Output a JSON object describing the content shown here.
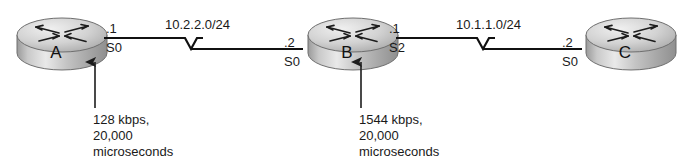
{
  "diagram": {
    "type": "network-topology",
    "background_color": "#ffffff",
    "line_color": "#111111",
    "router_body_color": "#b9b9b9",
    "router_top_color": "#d6d6d6",
    "routers": [
      {
        "id": "router-a",
        "name": "A",
        "interface_label": "S0",
        "ip_host_label": ".1",
        "icon": "router-icon"
      },
      {
        "id": "router-b",
        "name": "B",
        "left_interface_label": "S0",
        "left_ip_host_label": ".2",
        "right_interface_label": "S2",
        "right_ip_host_label": ".1",
        "icon": "router-icon"
      },
      {
        "id": "router-c",
        "name": "C",
        "interface_label": "S0",
        "ip_host_label": ".2",
        "icon": "router-icon"
      }
    ],
    "links": [
      {
        "id": "link-a-b",
        "subnet_label": "10.2.2.0/24",
        "media": "serial",
        "left_endpoint": "A S0 .1",
        "right_endpoint": "B S0 .2"
      },
      {
        "id": "link-b-c",
        "subnet_label": "10.1.1.0/24",
        "media": "serial",
        "left_endpoint": "B S2 .1",
        "right_endpoint": "C S0 .2"
      }
    ],
    "annotations": [
      {
        "id": "annotation-a-s0",
        "target": "router-a S0",
        "pointer": "arrow-up-icon",
        "lines": [
          "128 kbps,",
          "20,000",
          "microseconds"
        ],
        "bandwidth": "128 kbps",
        "delay": "20,000 microseconds"
      },
      {
        "id": "annotation-b-s2",
        "target": "router-b S2",
        "pointer": "arrow-up-icon",
        "lines": [
          "1544 kbps,",
          "20,000",
          "microseconds"
        ],
        "bandwidth": "1544 kbps",
        "delay": "20,000 microseconds"
      }
    ]
  }
}
